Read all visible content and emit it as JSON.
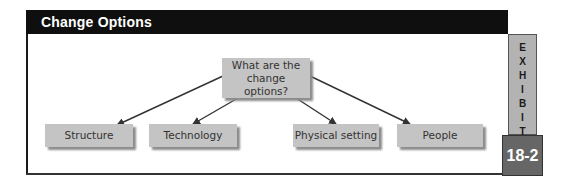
{
  "header": {
    "title": "Change Options"
  },
  "exhibit": {
    "label_letters": [
      "E",
      "X",
      "H",
      "I",
      "B",
      "I",
      "T"
    ],
    "number": "18-2"
  },
  "diagram": {
    "center": {
      "label": "What are the change options?"
    },
    "options": [
      {
        "label": "Structure"
      },
      {
        "label": "Technology"
      },
      {
        "label": "Physical setting"
      },
      {
        "label": "People"
      }
    ]
  },
  "colors": {
    "header_bg": "#0f0f0f",
    "node_bg": "#c4c4c4",
    "exhibit_bar": "#b3b3b3",
    "exhibit_num_bg": "#666666"
  }
}
